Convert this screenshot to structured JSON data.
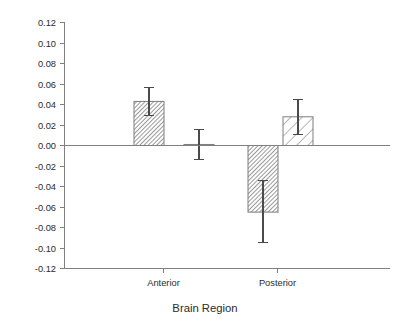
{
  "chart_data": {
    "type": "bar",
    "title": "",
    "xlabel": "Brain Region",
    "ylabel": "",
    "categories": [
      "Anterior",
      "Posterior"
    ],
    "ylim": [
      -0.12,
      0.12
    ],
    "ytick_values": [
      0.12,
      0.1,
      0.08,
      0.06,
      0.04,
      0.02,
      0.0,
      -0.02,
      -0.04,
      -0.06,
      -0.08,
      -0.1,
      -0.12
    ],
    "ytick_labels": [
      "0.12",
      "0.10",
      "0.08",
      "0.06",
      "0.04",
      "0.02",
      "0.00",
      "-0.02",
      "-0.04",
      "-0.06",
      "-0.08",
      "-0.10",
      "-0.12"
    ],
    "grid": false,
    "legend": "none",
    "series": [
      {
        "name": "Series 1",
        "pattern": "dense-diagonal-hatch",
        "values": [
          0.043,
          -0.065
        ],
        "errors_upper": [
          0.057,
          -0.034
        ],
        "errors_lower": [
          0.029,
          -0.095
        ]
      },
      {
        "name": "Series 2",
        "pattern": "sparse-diagonal-hatch",
        "values": [
          0.001,
          0.028
        ],
        "errors_upper": [
          0.016,
          0.045
        ],
        "errors_lower": [
          -0.014,
          0.011
        ]
      }
    ],
    "bars": [
      {
        "id": "bar-anterior-1",
        "category": "Anterior",
        "series": "Series 1",
        "value": 0.043,
        "err_top": 0.057,
        "err_bottom": 0.029,
        "pattern": "dense-diagonal-hatch"
      },
      {
        "id": "bar-anterior-2",
        "category": "Anterior",
        "series": "Series 2",
        "value": 0.001,
        "err_top": 0.016,
        "err_bottom": -0.014,
        "pattern": "sparse-diagonal-hatch"
      },
      {
        "id": "bar-posterior-1",
        "category": "Posterior",
        "series": "Series 1",
        "value": -0.065,
        "err_top": -0.034,
        "err_bottom": -0.095,
        "pattern": "dense-diagonal-hatch"
      },
      {
        "id": "bar-posterior-2",
        "category": "Posterior",
        "series": "Series 2",
        "value": 0.028,
        "err_top": 0.045,
        "err_bottom": 0.011,
        "pattern": "sparse-diagonal-hatch"
      }
    ],
    "colors": {
      "axis": "#808080",
      "bar_stroke": "#7d7d7d",
      "hatch": "#6e6e6e",
      "error_bar": "#4a4a4a",
      "text": "#2b2b2b",
      "background": "#ffffff"
    }
  }
}
